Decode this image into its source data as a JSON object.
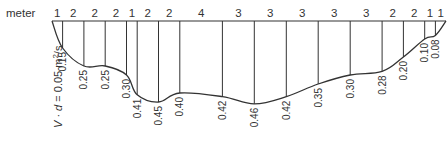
{
  "diagram": {
    "unit_label": "meter",
    "side_label": "V · d = 0.05 m²/s",
    "side_label_parts": {
      "v": "V",
      "dot": " · ",
      "d": "d",
      "rest": " = 0.05 m",
      "sup": "2",
      "tail": "/s"
    },
    "segment_widths": [
      1,
      2,
      2,
      2,
      1,
      2,
      2,
      4,
      3,
      3,
      3,
      3,
      3,
      2,
      2,
      1,
      1
    ],
    "segment_width_labels": [
      "1",
      "2",
      "2",
      "2",
      "1",
      "2",
      "2",
      "4",
      "3",
      "3",
      "3",
      "3",
      "3",
      "2",
      "2",
      "1",
      "1"
    ],
    "vertical_values": [
      0.15,
      0.25,
      0.25,
      0.3,
      0.41,
      0.45,
      0.4,
      0.42,
      0.46,
      0.42,
      0.35,
      0.3,
      0.28,
      0.2,
      0.1,
      0.08
    ],
    "vertical_value_labels": [
      "0.15",
      "0.25",
      "0.25",
      "0.30",
      "0.41",
      "0.45",
      "0.40",
      "0.42",
      "0.46",
      "0.42",
      "0.35",
      "0.30",
      "0.28",
      "0.20",
      "0.10",
      "0.08"
    ],
    "colors": {
      "line": "#333333",
      "text": "#333333",
      "background": "#ffffff"
    }
  }
}
